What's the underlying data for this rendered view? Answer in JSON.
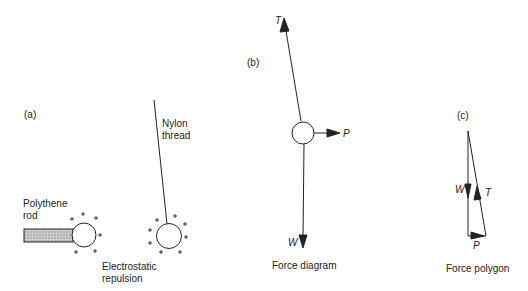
{
  "panels": {
    "a": {
      "tag": "(a)",
      "rod_label_1": "Polythene",
      "rod_label_2": "rod",
      "thread_label_1": "Nylon",
      "thread_label_2": "thread",
      "caption_1": "Electrostatic",
      "caption_2": "repulsion",
      "charge_symbol": "+"
    },
    "b": {
      "tag": "(b)",
      "force_T": "T",
      "force_P": "P",
      "force_W": "W",
      "caption": "Force diagram"
    },
    "c": {
      "tag": "(c)",
      "force_W": "W",
      "force_T": "T",
      "force_P": "P",
      "caption": "Force polygon"
    }
  },
  "colors": {
    "ink": "#222222",
    "background": "#ffffff"
  }
}
